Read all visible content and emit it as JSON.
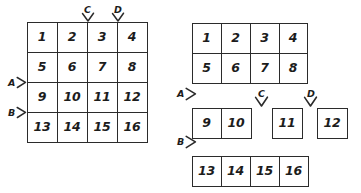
{
  "figure": {
    "stroke_color": "#2b2b2b",
    "text_color": "#1c1c1c",
    "background_color": "#ffffff"
  },
  "left_diagram": {
    "name": "original-grid",
    "rows": 4,
    "cols": 4,
    "cells": [
      [
        "1",
        "2",
        "3",
        "4"
      ],
      [
        "5",
        "6",
        "7",
        "8"
      ],
      [
        "9",
        "10",
        "11",
        "12"
      ],
      [
        "13",
        "14",
        "15",
        "16"
      ]
    ],
    "markers": [
      {
        "label": "A",
        "direction": "right",
        "axis": "horizontal",
        "position": "between-row-2-and-row-3"
      },
      {
        "label": "B",
        "direction": "right",
        "axis": "horizontal",
        "position": "between-row-3-and-row-4"
      },
      {
        "label": "C",
        "direction": "down",
        "axis": "vertical",
        "position": "between-col-2-and-col-3"
      },
      {
        "label": "D",
        "direction": "down",
        "axis": "vertical",
        "position": "between-col-3-and-col-4"
      }
    ]
  },
  "right_diagram": {
    "name": "split-grid",
    "fragments": [
      {
        "id": "block-top",
        "cells": [
          [
            "1",
            "2",
            "3",
            "4"
          ],
          [
            "5",
            "6",
            "7",
            "8"
          ]
        ]
      },
      {
        "id": "block-9-10",
        "cells": [
          [
            "9",
            "10"
          ]
        ]
      },
      {
        "id": "block-11",
        "cells": [
          [
            "11"
          ]
        ]
      },
      {
        "id": "block-12",
        "cells": [
          [
            "12"
          ]
        ]
      },
      {
        "id": "block-bottom",
        "cells": [
          [
            "13",
            "14",
            "15",
            "16"
          ]
        ]
      }
    ],
    "markers": [
      {
        "label": "A",
        "direction": "right",
        "axis": "horizontal",
        "position": "below-top-block"
      },
      {
        "label": "B",
        "direction": "right",
        "axis": "horizontal",
        "position": "below-middle-row"
      },
      {
        "label": "C",
        "direction": "down",
        "axis": "vertical",
        "position": "between-10-and-11"
      },
      {
        "label": "D",
        "direction": "down",
        "axis": "vertical",
        "position": "between-11-and-12"
      }
    ]
  }
}
